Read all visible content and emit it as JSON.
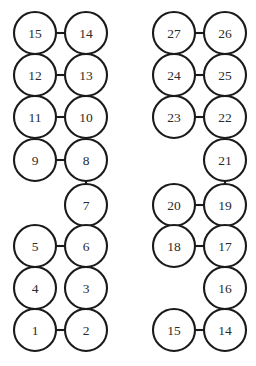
{
  "diagram": {
    "type": "node-link-graph",
    "title": "",
    "canvas": {
      "width": 256,
      "height": 366,
      "background": "#ffffff"
    },
    "style": {
      "node_fill": "#ffffff",
      "node_stroke": "#1a1a1a",
      "edge_stroke": "#1a1a1a",
      "label_color": "#2b2b2b",
      "node_radius": 21,
      "stroke_width": 2.1
    },
    "graphs": [
      {
        "name": "left-graph",
        "nodes": [
          {
            "id": "n15",
            "label": "15",
            "x": 35,
            "y": 33
          },
          {
            "id": "n14",
            "label": "14",
            "x": 86,
            "y": 33
          },
          {
            "id": "n12",
            "label": "12",
            "x": 35,
            "y": 75
          },
          {
            "id": "n13",
            "label": "13",
            "x": 86,
            "y": 75
          },
          {
            "id": "n11",
            "label": "11",
            "x": 35,
            "y": 117
          },
          {
            "id": "n10",
            "label": "10",
            "x": 86,
            "y": 117
          },
          {
            "id": "n9",
            "label": "9",
            "x": 35,
            "y": 160
          },
          {
            "id": "n8",
            "label": "8",
            "x": 86,
            "y": 160
          },
          {
            "id": "n7",
            "label": "7",
            "x": 86,
            "y": 205
          },
          {
            "id": "n5",
            "label": "5",
            "x": 35,
            "y": 246
          },
          {
            "id": "n6",
            "label": "6",
            "x": 86,
            "y": 246
          },
          {
            "id": "n4",
            "label": "4",
            "x": 35,
            "y": 288
          },
          {
            "id": "n3",
            "label": "3",
            "x": 86,
            "y": 288
          },
          {
            "id": "n1",
            "label": "1",
            "x": 35,
            "y": 330
          },
          {
            "id": "n2",
            "label": "2",
            "x": 86,
            "y": 330
          }
        ],
        "edges": [
          {
            "from": "n15",
            "to": "n14"
          },
          {
            "from": "n14",
            "to": "n13"
          },
          {
            "from": "n12",
            "to": "n13"
          },
          {
            "from": "n11",
            "to": "n10"
          },
          {
            "from": "n10",
            "to": "n8"
          },
          {
            "from": "n9",
            "to": "n8"
          },
          {
            "from": "n8",
            "to": "n7"
          },
          {
            "from": "n7",
            "to": "n6"
          },
          {
            "from": "n5",
            "to": "n6"
          },
          {
            "from": "n5",
            "to": "n4"
          },
          {
            "from": "n4",
            "to": "n1"
          },
          {
            "from": "n3",
            "to": "n2"
          },
          {
            "from": "n1",
            "to": "n2"
          }
        ]
      },
      {
        "name": "right-graph",
        "nodes": [
          {
            "id": "m27",
            "label": "27",
            "x": 174,
            "y": 33
          },
          {
            "id": "m26",
            "label": "26",
            "x": 225,
            "y": 33
          },
          {
            "id": "m24",
            "label": "24",
            "x": 174,
            "y": 75
          },
          {
            "id": "m25",
            "label": "25",
            "x": 225,
            "y": 75
          },
          {
            "id": "m23",
            "label": "23",
            "x": 174,
            "y": 117
          },
          {
            "id": "m22",
            "label": "22",
            "x": 225,
            "y": 117
          },
          {
            "id": "m21",
            "label": "21",
            "x": 225,
            "y": 160
          },
          {
            "id": "m20",
            "label": "20",
            "x": 174,
            "y": 205
          },
          {
            "id": "m19",
            "label": "19",
            "x": 225,
            "y": 205
          },
          {
            "id": "m18",
            "label": "18",
            "x": 174,
            "y": 246
          },
          {
            "id": "m17",
            "label": "17",
            "x": 225,
            "y": 246
          },
          {
            "id": "m16",
            "label": "16",
            "x": 225,
            "y": 288
          },
          {
            "id": "m15",
            "label": "15",
            "x": 174,
            "y": 330
          },
          {
            "id": "m14",
            "label": "14",
            "x": 225,
            "y": 330
          }
        ],
        "edges": [
          {
            "from": "m27",
            "to": "m26"
          },
          {
            "from": "m26",
            "to": "m25"
          },
          {
            "from": "m24",
            "to": "m25"
          },
          {
            "from": "m25",
            "to": "m22"
          },
          {
            "from": "m23",
            "to": "m22"
          },
          {
            "from": "m22",
            "to": "m21"
          },
          {
            "from": "m21",
            "to": "m19"
          },
          {
            "from": "m20",
            "to": "m19"
          },
          {
            "from": "m19",
            "to": "m17"
          },
          {
            "from": "m18",
            "to": "m17"
          },
          {
            "from": "m17",
            "to": "m16"
          },
          {
            "from": "m16",
            "to": "m14"
          },
          {
            "from": "m15",
            "to": "m14"
          }
        ]
      }
    ]
  }
}
